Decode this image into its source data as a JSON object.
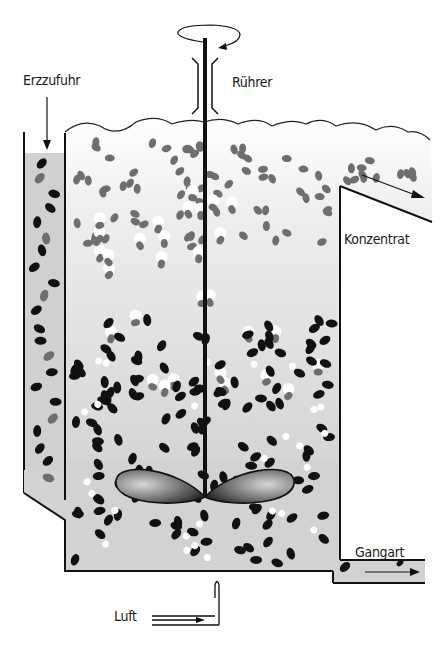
{
  "diagram": {
    "type": "flotation-cell",
    "labels": {
      "feed": "Erzzufuhr",
      "stirrer": "Rührer",
      "concentrate": "Konzentrat",
      "gangue": "Gangart",
      "air": "Luft"
    },
    "colors": {
      "outline": "#111111",
      "slurry": "#d4d4d4",
      "froth": "#f2f2f2",
      "ore_particle": "#111111",
      "mineral_particle": "#6e6e6e",
      "air_bubble": "#ffffff"
    }
  }
}
